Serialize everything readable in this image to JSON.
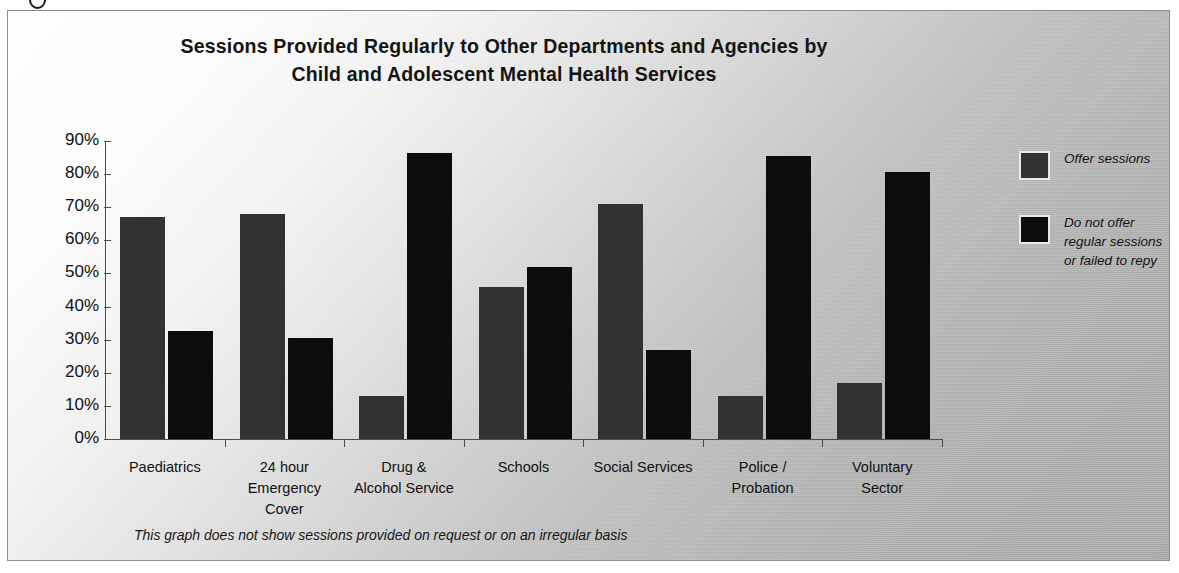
{
  "figure": {
    "title_line_1": "Sessions Provided Regularly to Other Departments and Agencies by",
    "title_line_2": "Child and Adolescent Mental Health Services",
    "footnote": "This graph does not show sessions provided on request or on an irregular basis"
  },
  "legend": {
    "position": "right",
    "items": [
      {
        "key": "offer",
        "color": "#323232",
        "label_lines": [
          "Offer sessions"
        ]
      },
      {
        "key": "nooffer",
        "color": "#0c0c0c",
        "label_lines": [
          "Do not offer",
          "regular sessions",
          "or failed to repy"
        ]
      }
    ]
  },
  "axes": {
    "y_title": "% of CAMHS",
    "y_ticks": [
      "90%",
      "80%",
      "70%",
      "60%",
      "50%",
      "40%",
      "30%",
      "20%",
      "10%",
      "0%"
    ]
  },
  "chart_data": {
    "type": "bar",
    "title": "Sessions Provided Regularly to Other Departments and Agencies by Child and Adolescent Mental Health Services",
    "xlabel": "",
    "ylabel": "% of CAMHS",
    "ylim": [
      0,
      90
    ],
    "ytick_step": 10,
    "grid": false,
    "legend_position": "right",
    "annotation": "This graph does not show sessions provided on request or on an irregular basis",
    "categories": [
      "Paediatrics",
      "24 hour Emergency Cover",
      "Drug & Alcohol Service",
      "Schools",
      "Social Services",
      "Police / Probation",
      "Voluntary Sector"
    ],
    "category_label_lines": [
      [
        "Paediatrics"
      ],
      [
        "24 hour",
        "Emergency",
        "Cover"
      ],
      [
        "Drug &",
        "Alcohol Service"
      ],
      [
        "Schools"
      ],
      [
        "Social Services"
      ],
      [
        "Police /",
        "Probation"
      ],
      [
        "Voluntary",
        "Sector"
      ]
    ],
    "series": [
      {
        "name": "Offer sessions",
        "color": "#323232",
        "values": [
          67,
          68,
          13,
          46,
          71,
          13,
          17
        ]
      },
      {
        "name": "Do not offer regular sessions or failed to repy",
        "color": "#0c0c0c",
        "values": [
          32.5,
          30.5,
          86.5,
          52,
          27,
          85.5,
          80.5
        ]
      }
    ]
  }
}
